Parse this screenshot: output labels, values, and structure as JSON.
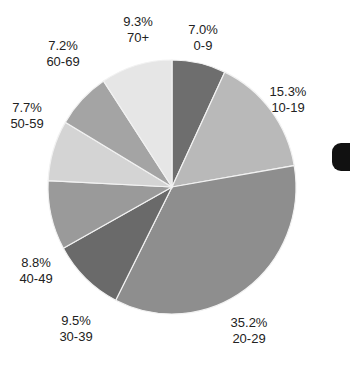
{
  "chart_data": {
    "type": "pie",
    "title": "",
    "start_angle_deg": 0,
    "direction": "clockwise",
    "categories": [
      "0-9",
      "10-19",
      "20-29",
      "30-39",
      "40-49",
      "50-59",
      "60-69",
      "70+"
    ],
    "values": [
      7.0,
      15.3,
      35.2,
      9.5,
      8.8,
      7.7,
      7.2,
      9.3
    ],
    "value_labels": [
      "7.0%",
      "15.3%",
      "35.2%",
      "9.5%",
      "8.8%",
      "7.7%",
      "7.2%",
      "9.3%"
    ],
    "colors": [
      "#6e6e6e",
      "#b9b9b9",
      "#8e8e8e",
      "#6a6a6a",
      "#9a9a9a",
      "#d4d4d4",
      "#a4a4a4",
      "#e6e6e6"
    ],
    "legend": "none",
    "data_labels": "percent and category outside slices"
  },
  "labels": [
    {
      "pct": "7.0%",
      "cat": "0-9"
    },
    {
      "pct": "15.3%",
      "cat": "10-19"
    },
    {
      "pct": "35.2%",
      "cat": "20-29"
    },
    {
      "pct": "9.5%",
      "cat": "30-39"
    },
    {
      "pct": "8.8%",
      "cat": "40-49"
    },
    {
      "pct": "7.7%",
      "cat": "50-59"
    },
    {
      "pct": "7.2%",
      "cat": "60-69"
    },
    {
      "pct": "9.3%",
      "cat": "70+"
    }
  ]
}
